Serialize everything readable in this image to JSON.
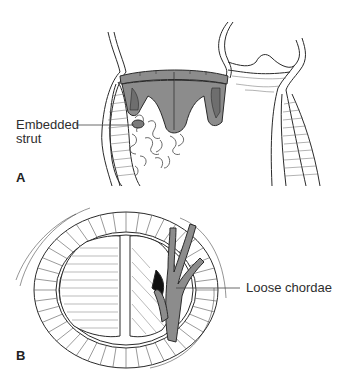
{
  "figure": {
    "panels": [
      {
        "id": "A",
        "letter": "A",
        "annotation": {
          "line1": "Embedded",
          "line2": "strut"
        }
      },
      {
        "id": "B",
        "letter": "B",
        "annotation": {
          "text": "Loose chordae"
        }
      }
    ],
    "colors": {
      "valve_fill": "#8c8c8c",
      "valve_dark": "#6e6e6e",
      "line": "#2a2a2a",
      "background": "#ffffff"
    }
  }
}
